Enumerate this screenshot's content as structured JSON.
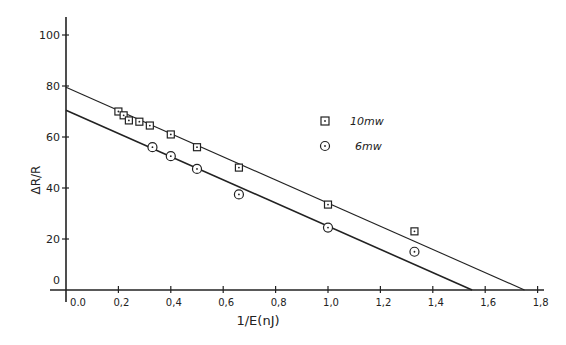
{
  "chart_data": {
    "type": "scatter",
    "title": "",
    "xlabel": "1/E(nJ)",
    "ylabel": "ΔR/R",
    "xlim": [
      0.0,
      1.8
    ],
    "ylim": [
      0,
      100
    ],
    "x_ticks": [
      "0.0",
      "0.2",
      "0.4",
      "0.6",
      "0.8",
      "1.0",
      "1.2",
      "1.4",
      "1.6",
      "1.8"
    ],
    "y_ticks": [
      "0",
      "20",
      "40",
      "60",
      "80",
      "100"
    ],
    "grid": false,
    "legend_position": "upper right (inside)",
    "series": [
      {
        "name": "10mw",
        "marker": "square-with-dot",
        "points": [
          [
            0.2,
            70
          ],
          [
            0.22,
            68.5
          ],
          [
            0.24,
            66.5
          ],
          [
            0.28,
            66
          ],
          [
            0.32,
            64.5
          ],
          [
            0.4,
            61
          ],
          [
            0.5,
            56
          ],
          [
            0.66,
            48
          ],
          [
            1.0,
            33.5
          ],
          [
            1.33,
            23
          ]
        ],
        "fit_line": {
          "x": [
            0.0,
            1.75
          ],
          "y": [
            79.5,
            0
          ]
        }
      },
      {
        "name": "6mw",
        "marker": "circle-with-dot",
        "points": [
          [
            0.33,
            56
          ],
          [
            0.4,
            52.5
          ],
          [
            0.5,
            47.5
          ],
          [
            0.66,
            37.5
          ],
          [
            1.0,
            24.5
          ],
          [
            1.33,
            15
          ]
        ],
        "fit_line": {
          "x": [
            0.0,
            1.55
          ],
          "y": [
            70.5,
            0
          ]
        }
      }
    ]
  }
}
